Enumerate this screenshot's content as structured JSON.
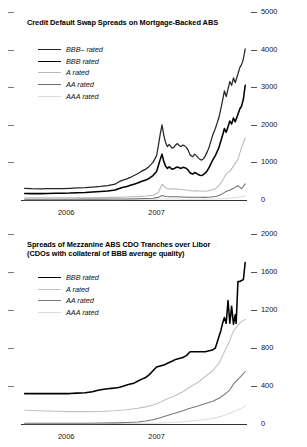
{
  "figure": {
    "panels": [
      "top",
      "bottom"
    ]
  },
  "chart_data": [
    {
      "id": "credit-default-swap-spreads",
      "type": "line",
      "title": "Credit Default Swap Spreads on Mortgage-Backed ABS",
      "xlabel": "",
      "ylabel": "",
      "ylim": [
        0,
        5000
      ],
      "yticks": [
        0,
        1000,
        2000,
        3000,
        4000,
        5000
      ],
      "ytick_labels": [
        "0",
        "1000",
        "2000",
        "3000",
        "4000",
        "5000"
      ],
      "xlim": [
        2005.5,
        2008.0
      ],
      "xticks": [
        2006,
        2007
      ],
      "xtick_labels": [
        "2006",
        "2007"
      ],
      "grid": false,
      "legend_position": "upper-left",
      "minor_tick_interval_months": 3,
      "series": [
        {
          "name": "BBB– rated",
          "color": "#262626",
          "width": 1.25,
          "x": [
            2005.54,
            2005.62,
            2005.71,
            2005.79,
            2005.88,
            2005.96,
            2006.04,
            2006.12,
            2006.21,
            2006.29,
            2006.38,
            2006.46,
            2006.54,
            2006.58,
            2006.62,
            2006.67,
            2006.71,
            2006.75,
            2006.79,
            2006.83,
            2006.88,
            2006.92,
            2006.96,
            2007.0,
            2007.02,
            2007.04,
            2007.06,
            2007.08,
            2007.1,
            2007.12,
            2007.14,
            2007.17,
            2007.19,
            2007.21,
            2007.23,
            2007.25,
            2007.27,
            2007.29,
            2007.31,
            2007.33,
            2007.35,
            2007.37,
            2007.4,
            2007.42,
            2007.44,
            2007.46,
            2007.48,
            2007.5,
            2007.52,
            2007.54,
            2007.56,
            2007.58,
            2007.6,
            2007.62,
            2007.65,
            2007.67,
            2007.69,
            2007.71,
            2007.73,
            2007.75,
            2007.77,
            2007.79,
            2007.81,
            2007.83,
            2007.85,
            2007.87,
            2007.9,
            2007.92,
            2007.94,
            2007.96,
            2007.98
          ],
          "values": [
            310,
            300,
            295,
            300,
            305,
            300,
            310,
            320,
            330,
            345,
            360,
            380,
            420,
            480,
            520,
            560,
            600,
            650,
            700,
            760,
            820,
            900,
            1000,
            1180,
            1450,
            1750,
            2000,
            1720,
            1520,
            1420,
            1480,
            1380,
            1400,
            1460,
            1500,
            1450,
            1420,
            1460,
            1440,
            1400,
            1320,
            1200,
            1150,
            1220,
            1180,
            1120,
            1080,
            1060,
            1100,
            1180,
            1280,
            1400,
            1560,
            1720,
            1900,
            2050,
            2200,
            2420,
            2650,
            2900,
            2750,
            2950,
            3150,
            3050,
            3250,
            3120,
            3350,
            3520,
            3600,
            3750,
            4020
          ]
        },
        {
          "name": "BBB rated",
          "color": "#000000",
          "width": 1.55,
          "x": [
            2005.54,
            2005.62,
            2005.71,
            2005.79,
            2005.88,
            2005.96,
            2006.04,
            2006.12,
            2006.21,
            2006.29,
            2006.38,
            2006.46,
            2006.54,
            2006.58,
            2006.62,
            2006.67,
            2006.71,
            2006.75,
            2006.79,
            2006.83,
            2006.88,
            2006.92,
            2006.96,
            2007.0,
            2007.02,
            2007.04,
            2007.06,
            2007.08,
            2007.1,
            2007.12,
            2007.14,
            2007.17,
            2007.19,
            2007.21,
            2007.23,
            2007.25,
            2007.27,
            2007.29,
            2007.31,
            2007.33,
            2007.35,
            2007.37,
            2007.4,
            2007.42,
            2007.44,
            2007.46,
            2007.48,
            2007.5,
            2007.52,
            2007.54,
            2007.56,
            2007.58,
            2007.6,
            2007.62,
            2007.65,
            2007.67,
            2007.69,
            2007.71,
            2007.73,
            2007.75,
            2007.77,
            2007.79,
            2007.81,
            2007.83,
            2007.85,
            2007.87,
            2007.9,
            2007.92,
            2007.94,
            2007.96,
            2007.98
          ],
          "values": [
            175,
            170,
            170,
            175,
            180,
            180,
            185,
            195,
            200,
            210,
            225,
            240,
            265,
            300,
            330,
            360,
            390,
            420,
            450,
            490,
            530,
            580,
            650,
            760,
            920,
            1080,
            1220,
            1020,
            900,
            840,
            880,
            820,
            830,
            860,
            880,
            860,
            840,
            870,
            860,
            840,
            790,
            720,
            690,
            730,
            710,
            680,
            660,
            650,
            680,
            720,
            780,
            860,
            960,
            1060,
            1180,
            1290,
            1400,
            1560,
            1720,
            1900,
            1800,
            1950,
            2100,
            2020,
            2180,
            2080,
            2280,
            2420,
            2500,
            2680,
            3050
          ]
        },
        {
          "name": "A rated",
          "color": "#b8b8b8",
          "width": 1.05,
          "x": [
            2005.54,
            2005.71,
            2005.88,
            2006.04,
            2006.21,
            2006.38,
            2006.54,
            2006.67,
            2006.79,
            2006.88,
            2006.96,
            2007.02,
            2007.06,
            2007.1,
            2007.14,
            2007.19,
            2007.23,
            2007.27,
            2007.31,
            2007.35,
            2007.4,
            2007.44,
            2007.48,
            2007.52,
            2007.56,
            2007.6,
            2007.65,
            2007.69,
            2007.73,
            2007.77,
            2007.81,
            2007.85,
            2007.9,
            2007.94,
            2007.98
          ],
          "values": [
            60,
            58,
            58,
            60,
            62,
            65,
            70,
            78,
            90,
            105,
            125,
            200,
            420,
            320,
            290,
            300,
            290,
            280,
            270,
            250,
            240,
            245,
            240,
            235,
            240,
            260,
            300,
            380,
            520,
            700,
            760,
            900,
            1080,
            1400,
            1650
          ]
        },
        {
          "name": "AA rated",
          "color": "#6e6e6e",
          "width": 1.05,
          "x": [
            2005.54,
            2005.71,
            2005.88,
            2006.04,
            2006.21,
            2006.38,
            2006.54,
            2006.67,
            2006.79,
            2006.88,
            2006.96,
            2007.02,
            2007.06,
            2007.1,
            2007.14,
            2007.19,
            2007.23,
            2007.27,
            2007.31,
            2007.35,
            2007.4,
            2007.44,
            2007.48,
            2007.52,
            2007.56,
            2007.6,
            2007.65,
            2007.69,
            2007.73,
            2007.77,
            2007.81,
            2007.85,
            2007.9,
            2007.94,
            2007.98
          ],
          "values": [
            22,
            21,
            21,
            22,
            23,
            24,
            26,
            28,
            32,
            38,
            45,
            70,
            120,
            95,
            85,
            88,
            85,
            82,
            78,
            75,
            72,
            74,
            72,
            70,
            74,
            82,
            95,
            120,
            170,
            230,
            260,
            310,
            380,
            300,
            430
          ]
        },
        {
          "name": "AAA rated",
          "color": "#dcdcdc",
          "width": 1.0,
          "x": [
            2005.54,
            2005.88,
            2006.21,
            2006.54,
            2006.79,
            2006.96,
            2007.06,
            2007.14,
            2007.23,
            2007.31,
            2007.4,
            2007.48,
            2007.56,
            2007.65,
            2007.73,
            2007.81,
            2007.9,
            2007.98
          ],
          "values": [
            10,
            10,
            11,
            12,
            14,
            18,
            30,
            26,
            24,
            22,
            21,
            20,
            22,
            26,
            34,
            48,
            70,
            110
          ]
        }
      ]
    },
    {
      "id": "mezzanine-abs-cdo-tranche-spreads",
      "type": "line",
      "title": "Spreads of Mezzanine ABS CDO Tranches over Libor\n(CDOs with collateral of BBB average quality)",
      "xlabel": "",
      "ylabel": "",
      "ylim": [
        0,
        2000
      ],
      "yticks": [
        0,
        400,
        800,
        1200,
        1600,
        2000
      ],
      "ytick_labels": [
        "0",
        "400",
        "800",
        "1200",
        "1600",
        "2000"
      ],
      "xlim": [
        2005.5,
        2008.0
      ],
      "xticks": [
        2006,
        2007
      ],
      "xtick_labels": [
        "2006",
        "2007"
      ],
      "grid": false,
      "legend_position": "upper-left",
      "minor_tick_interval_months": 3,
      "series": [
        {
          "name": "BBB rated",
          "color": "#000000",
          "width": 1.55,
          "x": [
            2005.54,
            2005.62,
            2005.71,
            2005.79,
            2005.88,
            2005.96,
            2006.04,
            2006.12,
            2006.21,
            2006.29,
            2006.33,
            2006.38,
            2006.42,
            2006.46,
            2006.5,
            2006.54,
            2006.58,
            2006.62,
            2006.67,
            2006.71,
            2006.75,
            2006.79,
            2006.83,
            2006.88,
            2006.92,
            2006.96,
            2007.0,
            2007.04,
            2007.08,
            2007.12,
            2007.17,
            2007.21,
            2007.25,
            2007.29,
            2007.33,
            2007.37,
            2007.42,
            2007.46,
            2007.5,
            2007.54,
            2007.58,
            2007.62,
            2007.65,
            2007.67,
            2007.69,
            2007.71,
            2007.73,
            2007.75,
            2007.77,
            2007.79,
            2007.81,
            2007.83,
            2007.85,
            2007.87,
            2007.88,
            2007.9,
            2007.92,
            2007.94,
            2007.96,
            2007.98
          ],
          "values": [
            320,
            320,
            320,
            320,
            320,
            320,
            320,
            325,
            330,
            340,
            350,
            360,
            365,
            370,
            375,
            380,
            385,
            395,
            410,
            420,
            430,
            450,
            470,
            490,
            520,
            560,
            600,
            610,
            620,
            640,
            660,
            680,
            690,
            700,
            720,
            760,
            760,
            760,
            760,
            760,
            770,
            780,
            800,
            860,
            920,
            980,
            1060,
            1120,
            1060,
            1300,
            1060,
            1240,
            1050,
            1150,
            1060,
            1500,
            1500,
            1510,
            1520,
            1700
          ]
        },
        {
          "name": "A rated",
          "color": "#c2c2c2",
          "width": 1.1,
          "x": [
            2005.54,
            2005.71,
            2005.88,
            2006.04,
            2006.21,
            2006.38,
            2006.54,
            2006.67,
            2006.79,
            2006.88,
            2006.96,
            2007.04,
            2007.12,
            2007.21,
            2007.29,
            2007.37,
            2007.46,
            2007.54,
            2007.62,
            2007.69,
            2007.75,
            2007.81,
            2007.85,
            2007.9,
            2007.94,
            2007.98
          ],
          "values": [
            145,
            140,
            135,
            130,
            130,
            132,
            140,
            150,
            165,
            180,
            200,
            230,
            265,
            300,
            340,
            390,
            440,
            500,
            560,
            640,
            760,
            880,
            980,
            1040,
            1080,
            1100
          ]
        },
        {
          "name": "AA rated",
          "color": "#787878",
          "width": 1.05,
          "x": [
            2005.54,
            2005.71,
            2005.88,
            2006.04,
            2006.21,
            2006.38,
            2006.54,
            2006.67,
            2006.79,
            2006.88,
            2006.96,
            2007.04,
            2007.12,
            2007.21,
            2007.29,
            2007.37,
            2007.46,
            2007.54,
            2007.62,
            2007.69,
            2007.75,
            2007.81,
            2007.85,
            2007.9,
            2007.94,
            2007.98
          ],
          "values": [
            8,
            8,
            8,
            8,
            9,
            10,
            12,
            16,
            22,
            32,
            45,
            65,
            90,
            115,
            140,
            165,
            190,
            215,
            240,
            270,
            310,
            360,
            420,
            470,
            510,
            550
          ]
        },
        {
          "name": "AAA rated",
          "color": "#dcdcdc",
          "width": 1.0,
          "x": [
            2005.54,
            2005.88,
            2006.21,
            2006.54,
            2006.79,
            2006.96,
            2007.12,
            2007.29,
            2007.46,
            2007.62,
            2007.75,
            2007.85,
            2007.94,
            2007.98
          ],
          "values": [
            4,
            4,
            4,
            5,
            6,
            8,
            14,
            24,
            38,
            58,
            90,
            130,
            165,
            190
          ]
        }
      ]
    }
  ]
}
